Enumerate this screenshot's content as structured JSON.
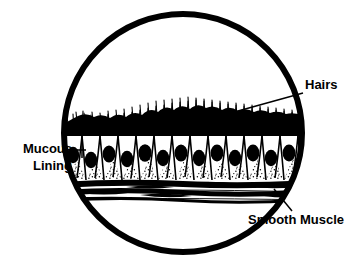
{
  "figure": {
    "background_color": "#ffffff",
    "ink_color": "#000000",
    "frame": {
      "shape": "circle",
      "center_x": 183,
      "center_y": 133,
      "radius": 122,
      "stroke_width": 6
    }
  },
  "labels": {
    "hairs": {
      "text": "Hairs",
      "x": 305,
      "y": 89,
      "anchor": "start",
      "leader_from_x": 303,
      "leader_from_y": 93,
      "leader_to_x": 209,
      "leader_to_y": 119
    },
    "mucous_lining": {
      "line1": "Mucous",
      "line2": "Lining",
      "x": 72,
      "y": 153,
      "anchor": "end",
      "leader_from_x": 74,
      "leader_from_y": 150,
      "leader_to_x": 86,
      "leader_to_y": 150,
      "tick_x": 82,
      "tick_top": 143,
      "tick_bottom": 158
    },
    "smooth_muscle": {
      "text": "Smooth Muscle",
      "x": 248,
      "y": 224,
      "anchor": "start",
      "leader_from_x": 292,
      "leader_from_y": 211,
      "leader_to_x": 274,
      "leader_to_y": 189
    }
  },
  "tissue_layers": [
    {
      "name": "cilia",
      "common_name": "Hairs",
      "description": "Dense black brush of fine hair-like cilia projecting upward from the apical surface",
      "top_y": 105,
      "bottom_y": 133,
      "fill": "#000000"
    },
    {
      "name": "apical-band",
      "description": "Solid dark terminal bar at the cell apices",
      "top_y": 131,
      "bottom_y": 136,
      "fill": "#000000"
    },
    {
      "name": "epithelium",
      "common_name": "Mucous Lining",
      "description": "Row of goblet-shaped columnar epithelial cells, each with a dark oval nucleus",
      "top_y": 136,
      "bottom_y": 178,
      "fill": "#ffffff",
      "cell_count": 14,
      "nucleus_fill": "#000000"
    },
    {
      "name": "basement-stipple",
      "description": "Stippled triangular wedges of connective tissue between the tapered cell bases",
      "top_y": 160,
      "bottom_y": 182,
      "fill": "#ffffff"
    },
    {
      "name": "smooth-muscle",
      "common_name": "Smooth Muscle",
      "description": "Wavy horizontal bands of elongated spindle-shaped muscle fibers",
      "top_y": 182,
      "bottom_y": 200,
      "fill": "#000000"
    }
  ],
  "geometry": {
    "tissue_left_x": 64,
    "tissue_right_x": 302,
    "cell_top_y": 136,
    "cell_base_y": 178,
    "nucleus_rx": 6.5,
    "nucleus_ry": 8.5
  }
}
